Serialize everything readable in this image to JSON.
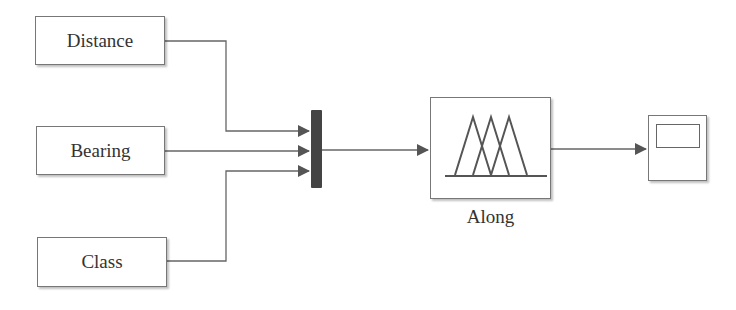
{
  "diagram": {
    "inputs": [
      {
        "id": "distance",
        "label": "Distance"
      },
      {
        "id": "bearing",
        "label": "Bearing"
      },
      {
        "id": "class",
        "label": "Class"
      }
    ],
    "mux": {
      "inputs": 3
    },
    "fuzzy_block": {
      "label": "Along",
      "icon": "triangular-membership-functions-icon"
    },
    "output": {
      "icon": "scope-icon"
    },
    "colors": {
      "line": "#666666",
      "block_border": "#777777",
      "mux_fill": "#444444"
    }
  }
}
